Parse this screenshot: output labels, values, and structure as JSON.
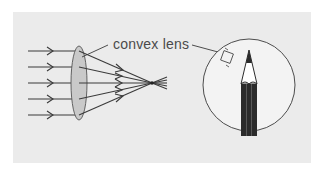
{
  "figure": {
    "label": "convex lens",
    "colors": {
      "background": "#ebebeb",
      "lens_fill": "#c9c9c9",
      "line": "#3a3a3a",
      "pencil_body": "#2b2b2b",
      "pencil_wood": "#ffffff",
      "circle_fill": "#f3f3f3"
    },
    "rays": {
      "count": 5,
      "y_positions": [
        51,
        67,
        83,
        99,
        115
      ]
    },
    "focal_point": {
      "x": 152,
      "y": 83
    },
    "lens": {
      "cx": 79,
      "cy": 83,
      "rx": 8,
      "ry": 37
    },
    "magnifier_circle": {
      "cx": 249,
      "cy": 85,
      "r": 46
    },
    "icons": [
      "arrow-ray-icon",
      "convex-lens-icon",
      "pencil-icon",
      "magnifier-circle-icon"
    ]
  }
}
